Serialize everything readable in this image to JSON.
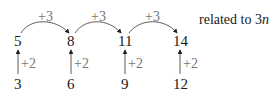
{
  "top_row": [
    "5",
    "8",
    "11",
    "14"
  ],
  "bottom_row": [
    "3",
    "6",
    "9",
    "12"
  ],
  "horizontal_step": "+3",
  "vertical_step": "+2",
  "note_prefix": "related to 3",
  "note_var": "n",
  "colors": {
    "text": "#1a1a1a",
    "label": "#777777",
    "arrow": "#333333"
  }
}
